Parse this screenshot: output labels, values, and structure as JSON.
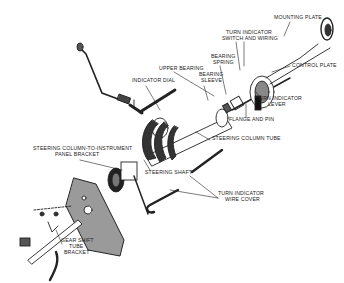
{
  "diagram": {
    "type": "exploded-view",
    "colors": {
      "line": "#222222",
      "fill_dark": "#333333",
      "plate": "#9a9a9a",
      "background": "#ffffff"
    },
    "labels": [
      {
        "id": "mounting-plate",
        "text": "MOUNTING PLATE",
        "x": 274,
        "y": 17
      },
      {
        "id": "turn-indicator-switch-and-wiring-1",
        "text": "TURN INDICATOR",
        "x": 226,
        "y": 32
      },
      {
        "id": "turn-indicator-switch-and-wiring-2",
        "text": "SWITCH AND WIRING",
        "x": 222,
        "y": 38
      },
      {
        "id": "bearing-spring-1",
        "text": "BEARING",
        "x": 211,
        "y": 56
      },
      {
        "id": "bearing-spring-2",
        "text": "SPRING",
        "x": 213,
        "y": 62
      },
      {
        "id": "control-plate",
        "text": "CONTROL PLATE",
        "x": 292,
        "y": 65
      },
      {
        "id": "upper-bearing",
        "text": "UPPER BEARING",
        "x": 159,
        "y": 68
      },
      {
        "id": "bearing-sleeve-1",
        "text": "BEARING",
        "x": 199,
        "y": 74
      },
      {
        "id": "bearing-sleeve-2",
        "text": "SLEEVE",
        "x": 201,
        "y": 80
      },
      {
        "id": "indicator-dial",
        "text": "INDICATOR DIAL",
        "x": 132,
        "y": 80
      },
      {
        "id": "turn-indicator-lever-1",
        "text": "TURN INDICATOR",
        "x": 256,
        "y": 98
      },
      {
        "id": "turn-indicator-lever-2",
        "text": "LEVER",
        "x": 268,
        "y": 104
      },
      {
        "id": "flange-and-pin",
        "text": "FLANGE AND PIN",
        "x": 229,
        "y": 119
      },
      {
        "id": "steering-column-tube",
        "text": "STEERING COLUMN TUBE",
        "x": 212,
        "y": 138
      },
      {
        "id": "steering-column-to-instrument-panel-bracket-1",
        "text": "STEERING COLUMN-TO-INSTRUMENT",
        "x": 33,
        "y": 148
      },
      {
        "id": "steering-column-to-instrument-panel-bracket-2",
        "text": "PANEL BRACKET",
        "x": 55,
        "y": 154
      },
      {
        "id": "steering-shaft",
        "text": "STEERING SHAFT",
        "x": 145,
        "y": 172
      },
      {
        "id": "turn-indicator-wire-cover-1",
        "text": "TURN INDICATOR",
        "x": 218,
        "y": 193
      },
      {
        "id": "turn-indicator-wire-cover-2",
        "text": "WIRE COVER",
        "x": 225,
        "y": 199
      },
      {
        "id": "gear-shift-tube-bracket-1",
        "text": "GEAR SHIFT",
        "x": 61,
        "y": 240
      },
      {
        "id": "gear-shift-tube-bracket-2",
        "text": "TUBE",
        "x": 69,
        "y": 246
      },
      {
        "id": "gear-shift-tube-bracket-3",
        "text": "BRACKET",
        "x": 64,
        "y": 252
      }
    ]
  }
}
